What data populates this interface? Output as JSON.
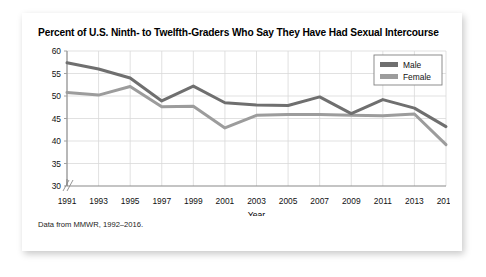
{
  "card": {
    "title": "Percent of U.S. Ninth- to Twelfth-Graders Who Say They Have Had Sexual Intercourse",
    "footnote": "Data from MMWR, 1992–2016."
  },
  "chart_data": {
    "type": "line",
    "title": "Percent of U.S. Ninth- to Twelfth-Graders Who Say They Have Had Sexual Intercourse",
    "xlabel": "Year",
    "ylabel": "",
    "categories": [
      1991,
      1993,
      1995,
      1997,
      1999,
      2001,
      2003,
      2005,
      2007,
      2009,
      2011,
      2013,
      2015
    ],
    "x_tick_labels": [
      "1991",
      "1993",
      "1995",
      "1997",
      "1999",
      "2001",
      "2003",
      "2005",
      "2007",
      "2009",
      "2011",
      "2013",
      "2015"
    ],
    "y_tick_labels": [
      "30",
      "35",
      "40",
      "45",
      "50",
      "55",
      "60"
    ],
    "ylim": [
      30,
      60
    ],
    "y_axis_break": true,
    "grid": true,
    "legend_position": "top-right",
    "series": [
      {
        "name": "Male",
        "color": "#6f6f6f",
        "values": [
          57.4,
          56.0,
          54.0,
          48.9,
          52.2,
          48.5,
          48.0,
          47.9,
          49.8,
          46.1,
          49.2,
          47.3,
          43.2
        ]
      },
      {
        "name": "Female",
        "color": "#9c9c9c",
        "values": [
          50.8,
          50.2,
          52.1,
          47.6,
          47.7,
          42.9,
          45.7,
          45.9,
          45.9,
          45.7,
          45.6,
          46.0,
          39.2
        ]
      }
    ]
  }
}
